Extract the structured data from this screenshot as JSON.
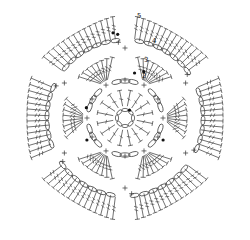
{
  "diagram": {
    "type": "crochet-chart",
    "center": [
      125,
      118
    ],
    "stroke_color": "#333333",
    "marker_color": "#111111",
    "round_labels": [
      {
        "text": "5",
        "x": 137,
        "y": 18
      },
      {
        "text": "4",
        "x": 152,
        "y": 43
      },
      {
        "text": "3",
        "x": 144,
        "y": 62
      },
      {
        "text": "2",
        "x": 142,
        "y": 78
      }
    ],
    "rounds": [
      {
        "round": 1,
        "stitch": "chain ring",
        "count": 8,
        "radius": 8
      },
      {
        "round": 2,
        "stitch": "double crochet",
        "count": 16,
        "r_inner": 12,
        "r_outer": 28
      },
      {
        "round": 3,
        "stitch": "chain arches",
        "groups": 6,
        "chains_per_group": 3,
        "radius": 37
      },
      {
        "round": 4,
        "stitch": "treble fans",
        "fans": 6,
        "stitches_per_fan": 8,
        "r_inner": 42,
        "r_outer": 62
      },
      {
        "round": 5,
        "stitch": "petal arches",
        "petals": 6,
        "stitches_per_petal": 14,
        "arch_radius": 80,
        "r_outer": 102
      }
    ],
    "petal_angles_deg": [
      -120,
      -60,
      0,
      60,
      120,
      180
    ]
  }
}
